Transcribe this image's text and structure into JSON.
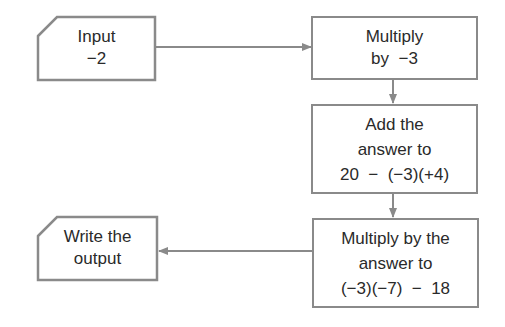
{
  "diagram": {
    "type": "flowchart",
    "colors": {
      "stroke": "#8a8a8a",
      "text": "#2a2a2a",
      "background": "#ffffff"
    },
    "nodes": [
      {
        "id": "input",
        "shape": "card",
        "lines": [
          "Input",
          "−2"
        ]
      },
      {
        "id": "multiply1",
        "shape": "rect",
        "lines": [
          "Multiply",
          "by  −3"
        ]
      },
      {
        "id": "add",
        "shape": "rect",
        "lines": [
          "Add the",
          "answer to",
          "20  −  (−3)(+4)"
        ]
      },
      {
        "id": "multiply2",
        "shape": "rect",
        "lines": [
          "Multiply by the",
          "answer to",
          "(−3)(−7)  −  18"
        ]
      },
      {
        "id": "output",
        "shape": "card",
        "lines": [
          "Write the",
          "output"
        ]
      }
    ],
    "edges": [
      {
        "from": "input",
        "to": "multiply1",
        "direction": "right"
      },
      {
        "from": "multiply1",
        "to": "add",
        "direction": "down"
      },
      {
        "from": "add",
        "to": "multiply2",
        "direction": "down"
      },
      {
        "from": "multiply2",
        "to": "output",
        "direction": "left"
      }
    ]
  }
}
